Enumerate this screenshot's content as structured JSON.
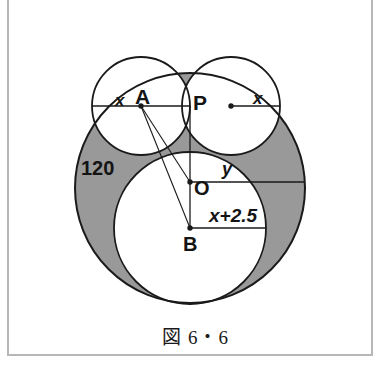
{
  "figure": {
    "caption": "図 6・6",
    "labels": {
      "x_left": "x",
      "point_A": "A",
      "point_P": "P",
      "x_right": "x",
      "angle_120": "120",
      "y": "y",
      "point_O": "O",
      "x_plus_2_5": "x+2.5",
      "point_B": "B"
    }
  },
  "colors": {
    "shaded_region": "#999999",
    "stroke": "#1a1a1a",
    "white_fill": "#ffffff",
    "page_background": "#ffffff",
    "frame_rule": "#b7b7b7"
  },
  "geometry": {
    "outer_circle": {
      "cx": 190,
      "cy": 188,
      "r": 115
    },
    "circle_A": {
      "cx": 141,
      "cy": 106,
      "r": 49
    },
    "circle_P": {
      "cx": 231,
      "cy": 106,
      "r": 49
    },
    "circle_B": {
      "cx": 190,
      "cy": 228,
      "r": 76
    },
    "point_A": {
      "x": 141,
      "y": 106
    },
    "point_P": {
      "x": 190,
      "y": 106
    },
    "point_O": {
      "x": 190,
      "y": 182
    },
    "point_B": {
      "x": 190,
      "y": 228
    },
    "radius_dot_right": {
      "x": 231,
      "y": 106
    }
  }
}
